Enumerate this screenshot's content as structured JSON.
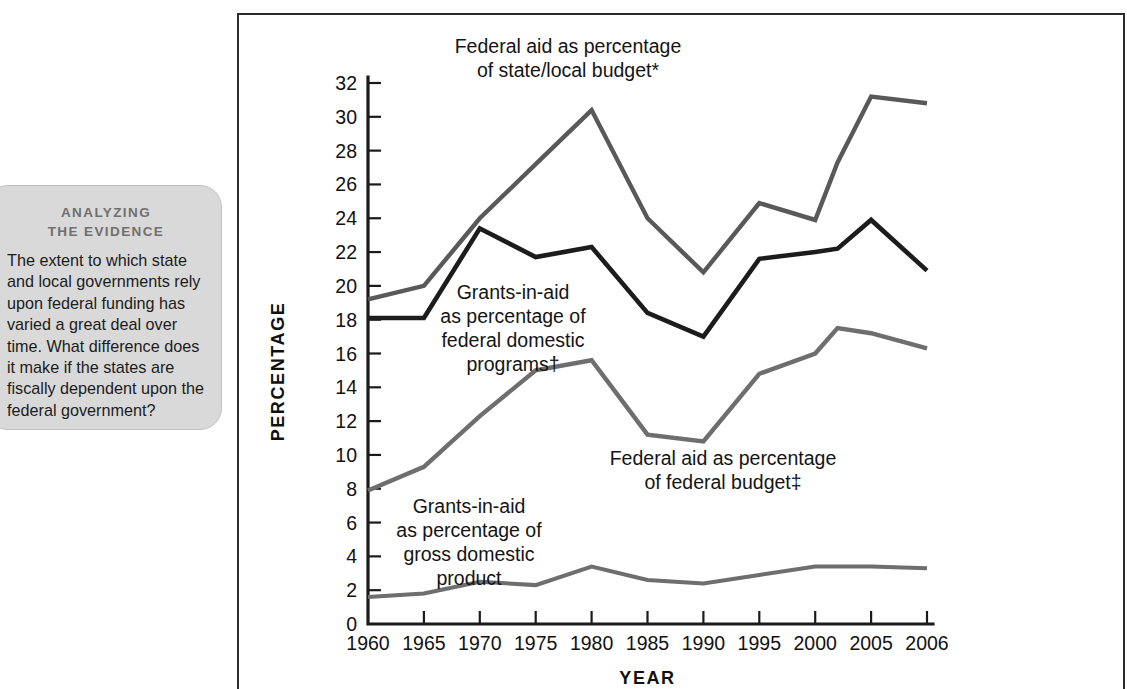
{
  "figure": {
    "callout": {
      "kicker_line1": "ANALYZING",
      "kicker_line2": "THE EVIDENCE",
      "body": "The extent to which state and local governments rely upon federal funding has varied a great deal over time. What difference does it make if the states are fiscally dependent upon the federal government?"
    }
  },
  "chart_data": {
    "type": "line",
    "title": "",
    "xlabel": "YEAR",
    "ylabel": "PERCENTAGE",
    "grid": false,
    "legend_position": "inline-annotations",
    "x": [
      1960,
      1965,
      1970,
      1975,
      1980,
      1985,
      1990,
      1995,
      2000,
      2002,
      2005,
      2006
    ],
    "tick_labels_x": [
      "1960",
      "1965",
      "1970",
      "1975",
      "1980",
      "1985",
      "1990",
      "1995",
      "2000",
      "2005",
      "2006"
    ],
    "xlim": [
      1960,
      2006
    ],
    "ylim": [
      0,
      32
    ],
    "ytick_step": 2,
    "tick_labels_y": [
      "0",
      "2",
      "4",
      "6",
      "8",
      "10",
      "12",
      "14",
      "16",
      "18",
      "20",
      "22",
      "24",
      "26",
      "28",
      "30",
      "32"
    ],
    "series": [
      {
        "name": "Federal aid as percentage of state/local budget*",
        "label_line1": "Federal aid as percentage",
        "label_line2": "of state/local budget*",
        "color": "#595959",
        "width": 4.4,
        "values": [
          19.2,
          20.0,
          24.0,
          27.2,
          30.4,
          24.0,
          20.8,
          24.9,
          23.9,
          27.3,
          31.2,
          30.8
        ]
      },
      {
        "name": "Grants-in-aid as percentage of federal domestic programs†",
        "label_line1": "Grants-in-aid",
        "label_line2": "as percentage of",
        "label_line3": "federal domestic",
        "label_line4": "programs†",
        "color": "#1c1c1c",
        "width": 4.6,
        "values": [
          18.1,
          18.1,
          23.4,
          21.7,
          22.3,
          18.4,
          17.0,
          21.6,
          22.0,
          22.2,
          23.9,
          20.9
        ]
      },
      {
        "name": "Federal aid as percentage of federal budget‡",
        "label_line1": "Federal aid as percentage",
        "label_line2": "of federal budget‡",
        "color": "#6e6e6e",
        "width": 4.4,
        "values": [
          7.9,
          9.3,
          12.3,
          15.0,
          15.6,
          11.2,
          10.8,
          14.8,
          16.0,
          17.5,
          17.2,
          16.3
        ]
      },
      {
        "name": "Grants-in-aid as percentage of gross domestic product",
        "label_line1": "Grants-in-aid",
        "label_line2": "as percentage of",
        "label_line3": "gross domestic",
        "label_line4": "product",
        "color": "#6e6e6e",
        "width": 4.0,
        "values": [
          1.6,
          1.8,
          2.5,
          2.3,
          3.4,
          2.6,
          2.4,
          2.9,
          3.4,
          3.4,
          3.4,
          3.3
        ]
      }
    ]
  }
}
